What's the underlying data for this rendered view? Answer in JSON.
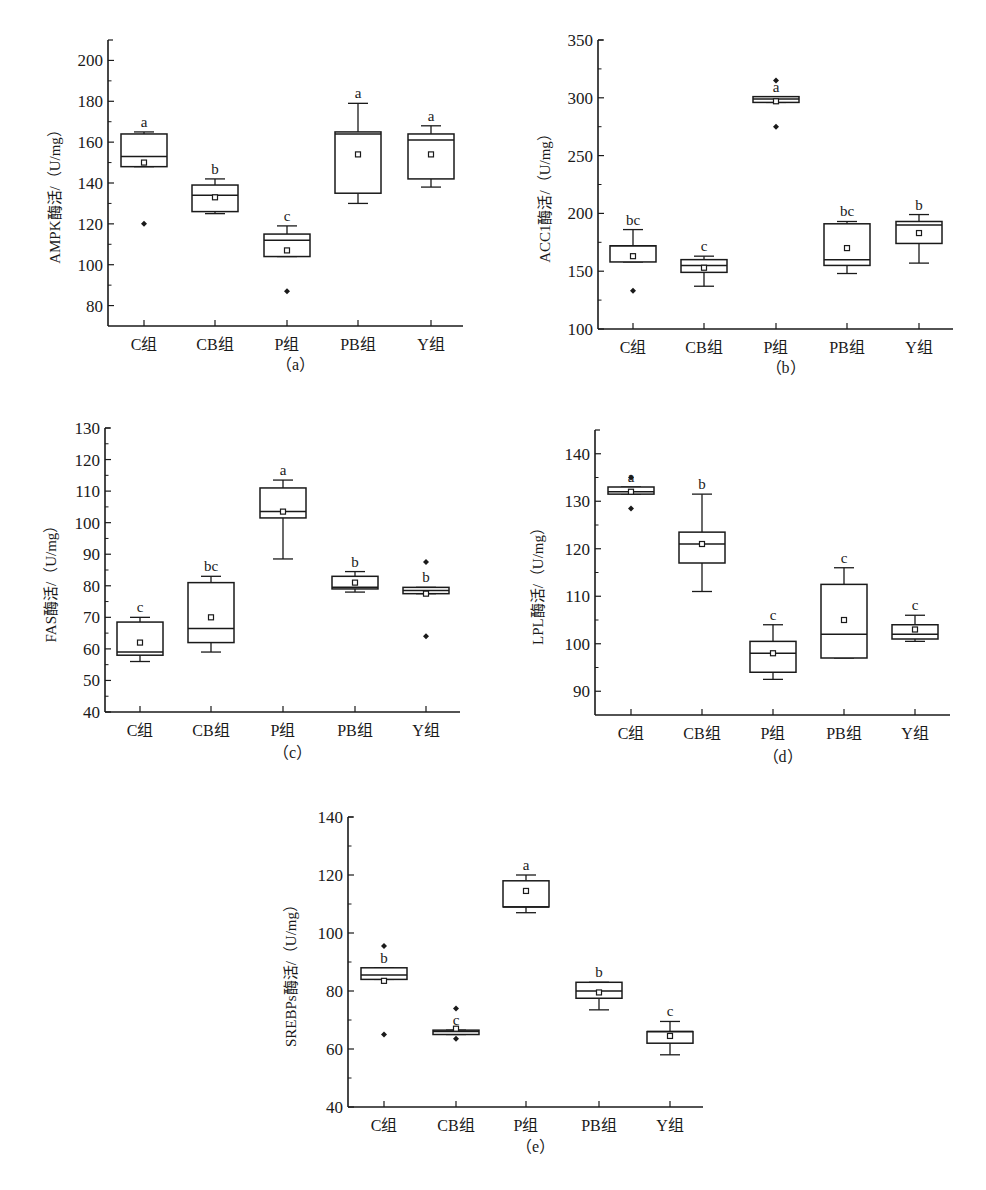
{
  "categories": [
    "C组",
    "CB组",
    "P组",
    "PB组",
    "Y组"
  ],
  "chart_data": [
    {
      "id": "a",
      "type": "box",
      "caption": "（a）",
      "ylabel": "AMPK酶活/（U/mg）",
      "xlabel": "",
      "categories": [
        "C组",
        "CB组",
        "P组",
        "PB组",
        "Y组"
      ],
      "yticks": [
        80,
        100,
        120,
        140,
        160,
        180,
        200
      ],
      "ylim": [
        70,
        210
      ],
      "grid": false,
      "series": [
        {
          "group": "C组",
          "whisker_low": 148,
          "q1": 148,
          "median": 153,
          "q3": 164,
          "whisker_high": 165,
          "mean": 150,
          "outliers": [
            120
          ],
          "sig": "a"
        },
        {
          "group": "CB组",
          "whisker_low": 125,
          "q1": 126,
          "median": 134,
          "q3": 139,
          "whisker_high": 142,
          "mean": 133,
          "outliers": [],
          "sig": "b"
        },
        {
          "group": "P组",
          "whisker_low": 104,
          "q1": 104,
          "median": 112,
          "q3": 115,
          "whisker_high": 119,
          "mean": 107,
          "outliers": [
            87
          ],
          "sig": "c"
        },
        {
          "group": "PB组",
          "whisker_low": 130,
          "q1": 135,
          "median": 164,
          "q3": 165,
          "whisker_high": 179,
          "mean": 154,
          "outliers": [],
          "sig": "a"
        },
        {
          "group": "Y组",
          "whisker_low": 138,
          "q1": 142,
          "median": 161,
          "q3": 164,
          "whisker_high": 168,
          "mean": 154,
          "outliers": [],
          "sig": "a"
        }
      ]
    },
    {
      "id": "b",
      "type": "box",
      "caption": "（b）",
      "ylabel": "ACC1酶活/（U/mg）",
      "xlabel": "",
      "categories": [
        "C组",
        "CB组",
        "P组",
        "PB组",
        "Y组"
      ],
      "yticks": [
        100,
        150,
        200,
        250,
        300,
        350
      ],
      "ylim": [
        100,
        350
      ],
      "grid": false,
      "series": [
        {
          "group": "C组",
          "whisker_low": 158,
          "q1": 158,
          "median": 172,
          "q3": 172,
          "whisker_high": 186,
          "mean": 163,
          "outliers": [
            133
          ],
          "sig": "bc"
        },
        {
          "group": "CB组",
          "whisker_low": 137,
          "q1": 149,
          "median": 155,
          "q3": 160,
          "whisker_high": 163,
          "mean": 153,
          "outliers": [],
          "sig": "c"
        },
        {
          "group": "P组",
          "whisker_low": 296,
          "q1": 296,
          "median": 299,
          "q3": 301,
          "whisker_high": 301,
          "mean": 297,
          "outliers": [
            315,
            275
          ],
          "sig": "a"
        },
        {
          "group": "PB组",
          "whisker_low": 148,
          "q1": 155,
          "median": 160,
          "q3": 191,
          "whisker_high": 193,
          "mean": 170,
          "outliers": [],
          "sig": "bc"
        },
        {
          "group": "Y组",
          "whisker_low": 157,
          "q1": 174,
          "median": 190,
          "q3": 193,
          "whisker_high": 199,
          "mean": 183,
          "outliers": [],
          "sig": "b"
        }
      ]
    },
    {
      "id": "c",
      "type": "box",
      "caption": "（c）",
      "ylabel": "FAS酶活/（U/mg）",
      "xlabel": "",
      "categories": [
        "C组",
        "CB组",
        "P组",
        "PB组",
        "Y组"
      ],
      "yticks": [
        40,
        50,
        60,
        70,
        80,
        90,
        100,
        110,
        120,
        130
      ],
      "ylim": [
        40,
        130
      ],
      "grid": false,
      "series": [
        {
          "group": "C组",
          "whisker_low": 56,
          "q1": 58,
          "median": 59,
          "q3": 68.5,
          "whisker_high": 70,
          "mean": 62,
          "outliers": [],
          "sig": "c"
        },
        {
          "group": "CB组",
          "whisker_low": 59,
          "q1": 62,
          "median": 66.5,
          "q3": 81,
          "whisker_high": 83,
          "mean": 70,
          "outliers": [],
          "sig": "bc"
        },
        {
          "group": "P组",
          "whisker_low": 88.5,
          "q1": 101.5,
          "median": 103.5,
          "q3": 111,
          "whisker_high": 113.5,
          "mean": 103.5,
          "outliers": [],
          "sig": "a"
        },
        {
          "group": "PB组",
          "whisker_low": 78,
          "q1": 79,
          "median": 79.5,
          "q3": 83,
          "whisker_high": 84.5,
          "mean": 81,
          "outliers": [],
          "sig": "b"
        },
        {
          "group": "Y组",
          "whisker_low": 77.5,
          "q1": 77.5,
          "median": 78.5,
          "q3": 79.5,
          "whisker_high": 79.5,
          "mean": 77.5,
          "outliers": [
            87.5,
            64
          ],
          "sig": "b"
        }
      ]
    },
    {
      "id": "d",
      "type": "box",
      "caption": "（d）",
      "ylabel": "LPL酶活/（U/mg）",
      "xlabel": "",
      "categories": [
        "C组",
        "CB组",
        "P组",
        "PB组",
        "Y组"
      ],
      "yticks": [
        90,
        100,
        110,
        120,
        130,
        140
      ],
      "ylim": [
        85,
        145
      ],
      "grid": false,
      "series": [
        {
          "group": "C组",
          "whisker_low": 131.5,
          "q1": 131.5,
          "median": 132,
          "q3": 133,
          "whisker_high": 133,
          "mean": 132,
          "outliers": [
            135,
            128.5
          ],
          "sig": "a"
        },
        {
          "group": "CB组",
          "whisker_low": 111,
          "q1": 117,
          "median": 121,
          "q3": 123.5,
          "whisker_high": 131.5,
          "mean": 121,
          "outliers": [],
          "sig": "b"
        },
        {
          "group": "P组",
          "whisker_low": 92.5,
          "q1": 94,
          "median": 98,
          "q3": 100.5,
          "whisker_high": 104,
          "mean": 98,
          "outliers": [],
          "sig": "c"
        },
        {
          "group": "PB组",
          "whisker_low": 97,
          "q1": 97,
          "median": 102,
          "q3": 112.5,
          "whisker_high": 116,
          "mean": 105,
          "outliers": [],
          "sig": "c"
        },
        {
          "group": "Y组",
          "whisker_low": 100.5,
          "q1": 101,
          "median": 102,
          "q3": 104,
          "whisker_high": 106,
          "mean": 103,
          "outliers": [],
          "sig": "c"
        }
      ]
    },
    {
      "id": "e",
      "type": "box",
      "caption": "（e）",
      "ylabel": "SREBPs酶活/（U/mg）",
      "xlabel": "",
      "categories": [
        "C组",
        "CB组",
        "P组",
        "PB组",
        "Y组"
      ],
      "yticks": [
        40,
        60,
        80,
        100,
        120,
        140
      ],
      "ylim": [
        40,
        140
      ],
      "grid": false,
      "series": [
        {
          "group": "C组",
          "whisker_low": 84,
          "q1": 84,
          "median": 85.5,
          "q3": 88,
          "whisker_high": 88,
          "mean": 83.5,
          "outliers": [
            95.5,
            65
          ],
          "sig": "b"
        },
        {
          "group": "CB组",
          "whisker_low": 65,
          "q1": 65,
          "median": 66,
          "q3": 66.5,
          "whisker_high": 66.5,
          "mean": 67,
          "outliers": [
            74,
            63.5
          ],
          "sig": "c"
        },
        {
          "group": "P组",
          "whisker_low": 107,
          "q1": 109,
          "median": 109,
          "q3": 118,
          "whisker_high": 120,
          "mean": 114.5,
          "outliers": [],
          "sig": "a"
        },
        {
          "group": "PB组",
          "whisker_low": 73.5,
          "q1": 77.5,
          "median": 80,
          "q3": 83,
          "whisker_high": 83,
          "mean": 79.5,
          "outliers": [],
          "sig": "b"
        },
        {
          "group": "Y组",
          "whisker_low": 58,
          "q1": 62,
          "median": 66,
          "q3": 66,
          "whisker_high": 69.5,
          "mean": 64.5,
          "outliers": [],
          "sig": "c"
        }
      ]
    }
  ]
}
